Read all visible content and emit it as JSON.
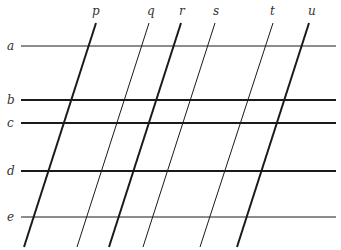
{
  "diagram": {
    "title": "",
    "colors": {
      "line": "#1a1a1a",
      "label": "#333333",
      "background": "#ffffff"
    },
    "horizontal_lines": [
      {
        "label": "a",
        "y": 46,
        "x1": 21,
        "x2": 336,
        "weight": "thin"
      },
      {
        "label": "b",
        "y": 100,
        "x1": 21,
        "x2": 336,
        "weight": "thick"
      },
      {
        "label": "c",
        "y": 123,
        "x1": 21,
        "x2": 336,
        "weight": "thick"
      },
      {
        "label": "d",
        "y": 171,
        "x1": 21,
        "x2": 336,
        "weight": "thick"
      },
      {
        "label": "e",
        "y": 217,
        "x1": 21,
        "x2": 336,
        "weight": "thin"
      }
    ],
    "slanted_lines": [
      {
        "label": "p",
        "x_top": 96,
        "y_top": 23,
        "x_bottom": 24,
        "y_bottom": 247,
        "weight": "thick"
      },
      {
        "label": "q",
        "x_top": 149,
        "y_top": 23,
        "x_bottom": 77,
        "y_bottom": 247,
        "weight": "thin"
      },
      {
        "label": "r",
        "x_top": 181,
        "y_top": 23,
        "x_bottom": 109,
        "y_bottom": 247,
        "weight": "thick"
      },
      {
        "label": "s",
        "x_top": 215,
        "y_top": 23,
        "x_bottom": 143,
        "y_bottom": 247,
        "weight": "thin"
      },
      {
        "label": "t",
        "x_top": 273,
        "y_top": 23,
        "x_bottom": 200,
        "y_bottom": 247,
        "weight": "thin"
      },
      {
        "label": "u",
        "x_top": 309,
        "y_top": 23,
        "x_bottom": 237,
        "y_bottom": 247,
        "weight": "thick"
      }
    ],
    "labels": {
      "a": "a",
      "b": "b",
      "c": "c",
      "d": "d",
      "e": "e",
      "p": "p",
      "q": "q",
      "r": "r",
      "s": "s",
      "t": "t",
      "u": "u"
    }
  }
}
